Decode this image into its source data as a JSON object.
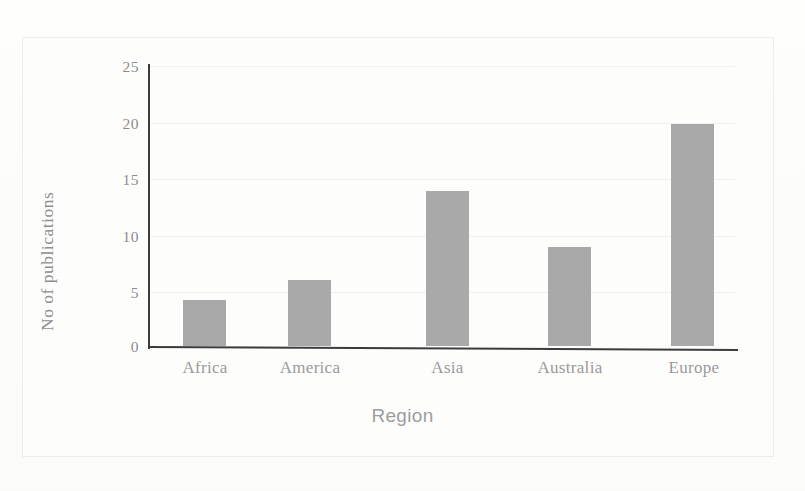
{
  "chart_data": {
    "type": "bar",
    "title": "",
    "categories": [
      "Africa",
      "America",
      "Asia",
      "Australia",
      "Europe"
    ],
    "values": [
      4.1,
      5.9,
      13.8,
      8.8,
      19.8
    ],
    "xlabel": "Region",
    "ylabel": "No of publications",
    "ylim": [
      0,
      25
    ],
    "yticks": [
      0,
      5,
      10,
      15,
      20,
      25
    ],
    "ytick_labels": [
      "0",
      "5",
      "10",
      "15",
      "20",
      "25"
    ],
    "grid": true,
    "grid_axis": "y",
    "legend": null,
    "bar_color": "#a9a9a9",
    "axis_color": "#3c3c3c",
    "text_color": "#8f8f8f"
  },
  "axis": {
    "y_tick_0": "0",
    "y_tick_1": "5",
    "y_tick_2": "10",
    "y_tick_3": "15",
    "y_tick_4": "20",
    "y_tick_5": "25",
    "x_cat_0": "Africa",
    "x_cat_1": "America",
    "x_cat_2": "Asia",
    "x_cat_3": "Australia",
    "x_cat_4": "Europe",
    "x_title": "Region",
    "y_title": "No of publications"
  }
}
